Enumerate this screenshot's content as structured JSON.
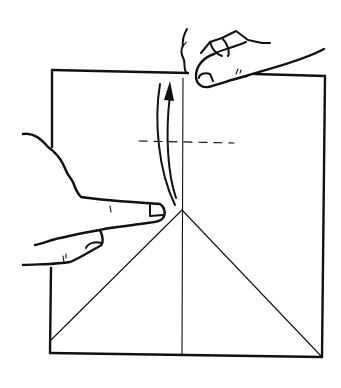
{
  "diagram": {
    "type": "origami-instruction-step",
    "colors": {
      "ink": "#111111",
      "paper": "#ffffff"
    },
    "elements": {
      "sheet": "square-paper",
      "center_crease": "vertical-valley-line",
      "diagonal_folds": [
        "left-diagonal",
        "right-diagonal"
      ],
      "fold_guide": "dashed-horizontal-line",
      "arrow": "curved-fold-up-arrow",
      "hands": [
        "right-hand-pinching-top-edge",
        "left-hand-holding-side"
      ]
    }
  }
}
